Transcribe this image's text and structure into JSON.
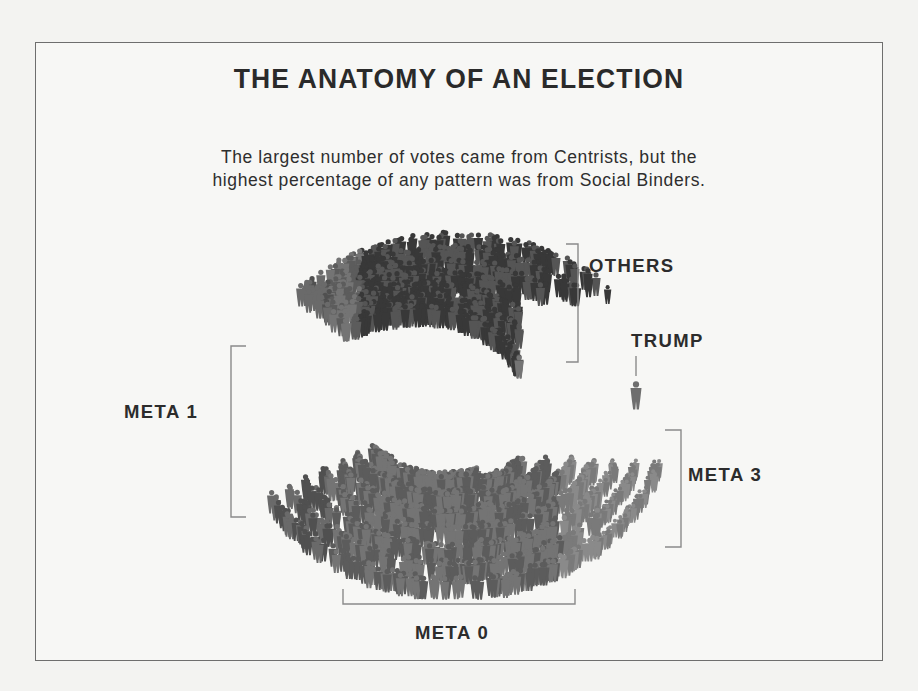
{
  "title": "THE ANATOMY OF AN ELECTION",
  "subtitle": {
    "line1": "The largest number of votes came from Centrists, but the",
    "line2": "highest percentage of any pattern was from Social Binders."
  },
  "groups": [
    {
      "id": "others",
      "label": "OTHERS",
      "color": "#3e3e3e"
    },
    {
      "id": "trump",
      "label": "TRUMP",
      "color": "#7a7a7a"
    },
    {
      "id": "meta1",
      "label": "META 1",
      "color": "#5a5a5a"
    },
    {
      "id": "meta3",
      "label": "META 3",
      "color": "#7c7c7c"
    },
    {
      "id": "meta0",
      "label": "META 0",
      "color": "#6a6a6a"
    }
  ],
  "colors": {
    "background": "#f3f3f1",
    "frame": "#6e6e6e",
    "text": "#2c2c2c",
    "bracket": "#8a8a8a"
  }
}
